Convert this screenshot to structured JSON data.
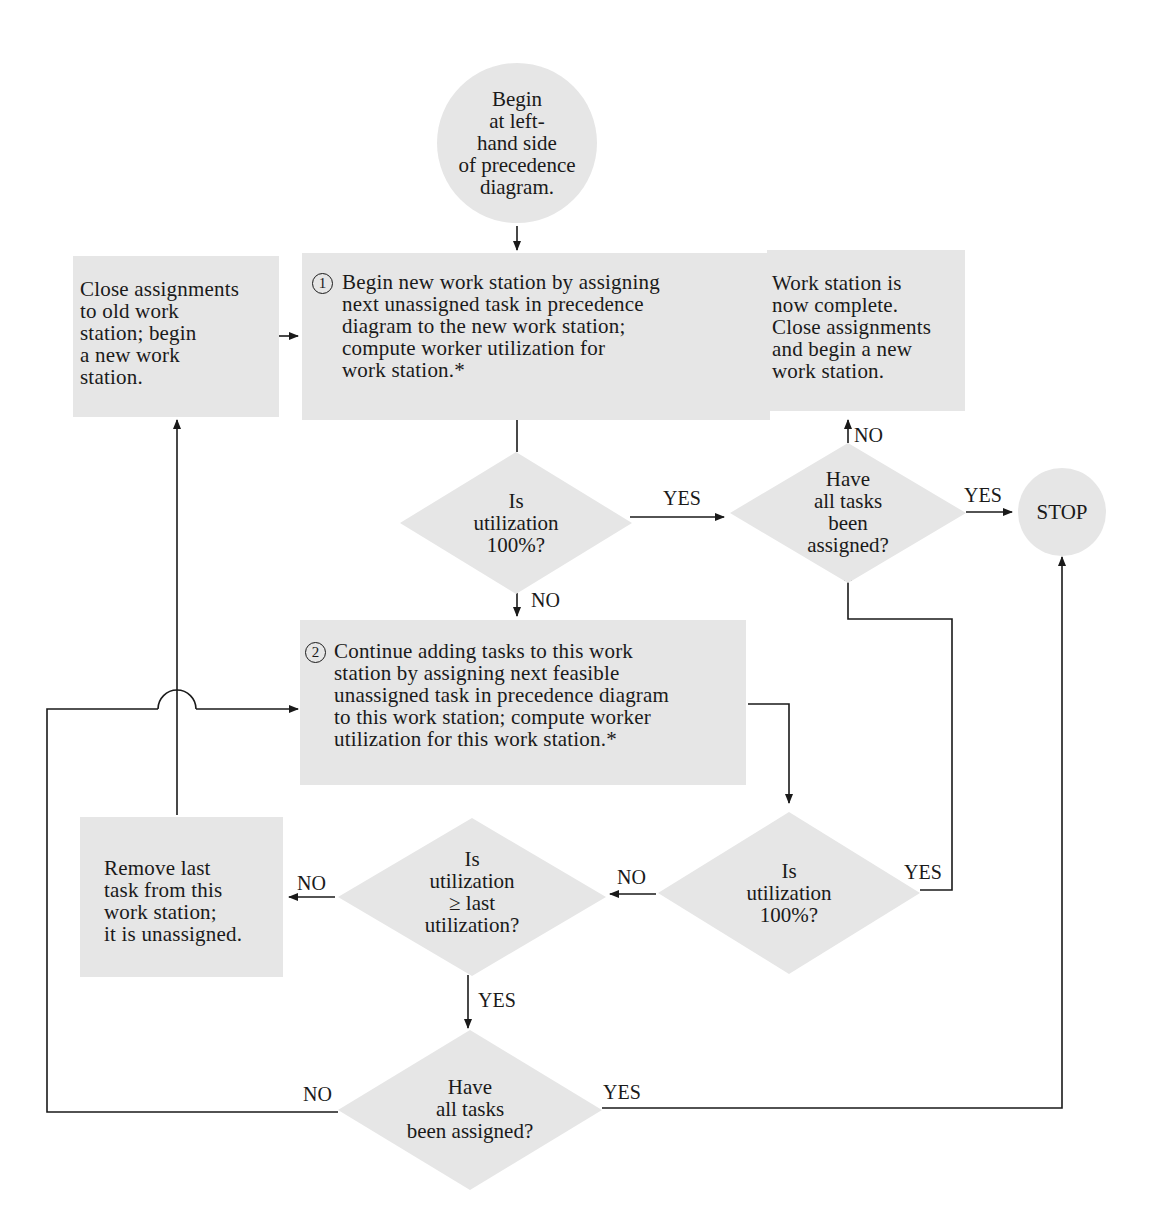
{
  "flowchart": {
    "start": {
      "text": "Begin\nat left-\nhand side\nof precedence\ndiagram."
    },
    "close_old": {
      "text": "Close assignments\nto old work\nstation; begin\na new work\nstation."
    },
    "step1": {
      "number": "1",
      "text": "Begin new work station by assigning\nnext unassigned task in precedence\ndiagram to the new work station;\ncompute worker utilization for\nwork station.*"
    },
    "ws_complete": {
      "text": "Work station is\nnow complete.\nClose assignments\nand begin a new\nwork station."
    },
    "decision_util_100_a": {
      "text": "Is\nutilization\n100%?"
    },
    "decision_all_assigned_a": {
      "text": "Have\nall tasks\nbeen\nassigned?"
    },
    "stop": {
      "text": "STOP"
    },
    "step2": {
      "number": "2",
      "text": "Continue adding tasks to this work\nstation by assigning next feasible\nunassigned task in precedence diagram\nto this work station; compute worker\nutilization for this work station.*"
    },
    "remove_last": {
      "text": "Remove last\ntask from this\nwork station;\nit is unassigned."
    },
    "decision_util_ge_last": {
      "text": "Is\nutilization\n≥ last\nutilization?"
    },
    "decision_util_100_b": {
      "text": "Is\nutilization\n100%?"
    },
    "decision_all_assigned_b": {
      "text": "Have\nall tasks\nbeen assigned?"
    },
    "labels": {
      "yes_util_a": "YES",
      "no_util_a": "NO",
      "no_all_a": "NO",
      "yes_all_a": "YES",
      "no_util_b": "NO",
      "yes_util_b": "YES",
      "no_ge_last": "NO",
      "yes_ge_last": "YES",
      "no_all_b": "NO",
      "yes_all_b": "YES"
    }
  },
  "colors": {
    "fill": "#e6e6e6",
    "line": "#1a1a1a"
  }
}
